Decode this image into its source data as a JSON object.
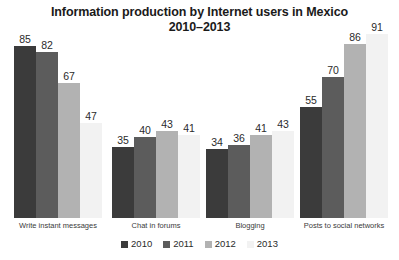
{
  "chart_data": {
    "type": "bar",
    "title": "Information production by Internet users in Mexico 2010–2013",
    "title_line1": "Information production by Internet users in Mexico",
    "title_line2": "2010–2013",
    "xlabel": "",
    "ylabel": "",
    "ylim": [
      0,
      100
    ],
    "grid": false,
    "legend_position": "bottom",
    "categories": [
      "Write instant messages",
      "Chat in forums",
      "Blogging",
      "Posts to social networks"
    ],
    "series": [
      {
        "name": "2010",
        "color": "#3b3b3b",
        "values": [
          85,
          35,
          34,
          55
        ]
      },
      {
        "name": "2011",
        "color": "#5c5c5c",
        "values": [
          82,
          40,
          36,
          70
        ]
      },
      {
        "name": "2012",
        "color": "#b2b2b2",
        "values": [
          67,
          43,
          41,
          86
        ]
      },
      {
        "name": "2013",
        "color": "#f2f2f2",
        "values": [
          47,
          41,
          43,
          91
        ]
      }
    ]
  },
  "legend": {
    "items": [
      {
        "label": "2010",
        "color": "#3b3b3b"
      },
      {
        "label": "2011",
        "color": "#5c5c5c"
      },
      {
        "label": "2012",
        "color": "#b2b2b2"
      },
      {
        "label": "2013",
        "color": "#f2f2f2"
      }
    ]
  }
}
